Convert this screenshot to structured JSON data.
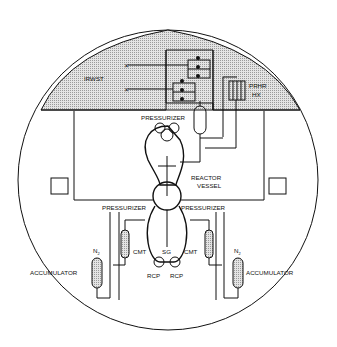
{
  "diagram": {
    "type": "containment-schematic",
    "labels": {
      "irwst": "IRWST",
      "prhr_line1": "PRHR",
      "prhr_line2": "HX",
      "pressurizer_top": "PRESSURIZER",
      "reactor_line1": "REACTOR",
      "reactor_line2": "VESSEL",
      "pressurizer_left": "PRESSURIZER",
      "pressurizer_right": "PRESSURIZER",
      "sg": "SG",
      "cmt_left": "CMT",
      "cmt_right": "CMT",
      "rcp_left": "RCP",
      "rcp_right": "RCP",
      "n2_left": "N",
      "n2_right": "N",
      "n2_sub": "2",
      "accumulator_left": "ACCUMULATOR",
      "accumulator_right": "ACCUMULATOR"
    },
    "colors": {
      "line": "#111111",
      "hatch": "#bdbdbd",
      "background": "#ffffff"
    }
  }
}
